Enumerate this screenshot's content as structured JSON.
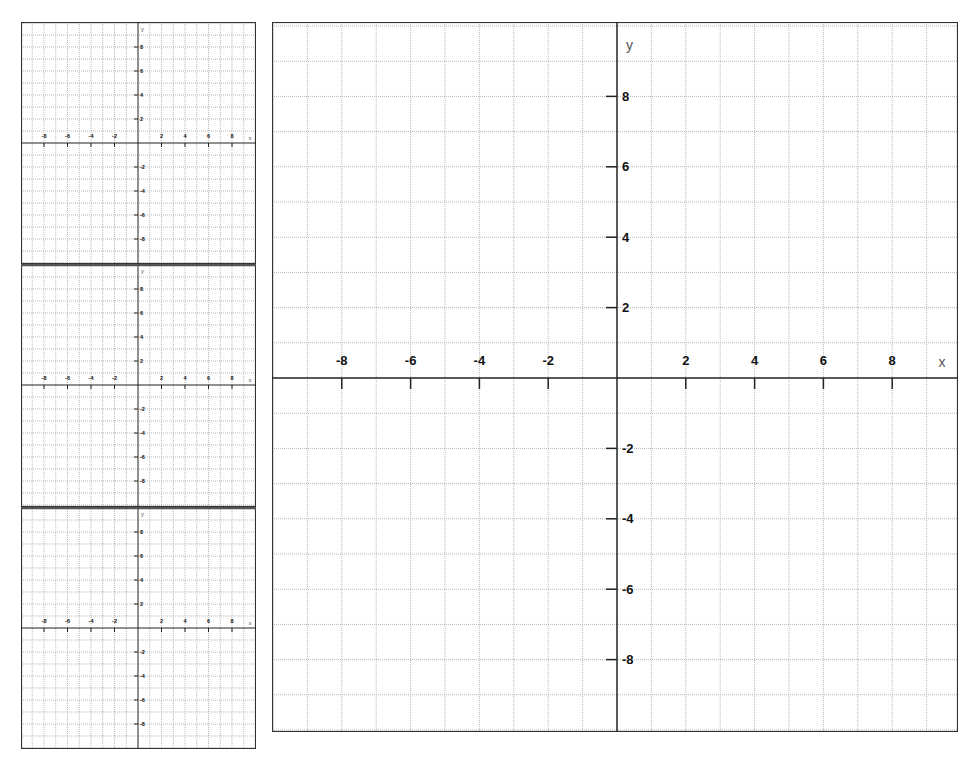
{
  "colors": {
    "background": "#ffffff",
    "grid": "#b8b8b8",
    "axis": "#222222",
    "border": "#333333",
    "divider": "#555555",
    "label": "#111111",
    "axis_name": "#555555"
  },
  "main_graph": {
    "x_axis_label": "x",
    "y_axis_label": "y",
    "x_range": [
      -10,
      10
    ],
    "y_range": [
      -10,
      10
    ],
    "grid_step": 1,
    "x_tick_labels": [
      "-8",
      "-6",
      "-4",
      "-2",
      "2",
      "4",
      "6",
      "8"
    ],
    "x_tick_values": [
      -8,
      -6,
      -4,
      -2,
      2,
      4,
      6,
      8
    ],
    "y_tick_labels": [
      "8",
      "6",
      "4",
      "2",
      "-2",
      "-4",
      "-6",
      "-8"
    ],
    "y_tick_values": [
      8,
      6,
      4,
      2,
      -2,
      -4,
      -6,
      -8
    ]
  },
  "small_graphs": [
    {
      "x_axis_label": "x",
      "y_axis_label": "y",
      "x_tick_labels": [
        "-8",
        "-6",
        "-4",
        "-2",
        "2",
        "4",
        "6",
        "8"
      ],
      "x_tick_values": [
        -8,
        -6,
        -4,
        -2,
        2,
        4,
        6,
        8
      ],
      "y_tick_labels": [
        "8",
        "6",
        "4",
        "2",
        "-2",
        "-4",
        "-6",
        "-8"
      ],
      "y_tick_values": [
        8,
        6,
        4,
        2,
        -2,
        -4,
        -6,
        -8
      ]
    },
    {
      "x_axis_label": "x",
      "y_axis_label": "y",
      "x_tick_labels": [
        "-8",
        "-6",
        "-4",
        "-2",
        "2",
        "4",
        "6",
        "8"
      ],
      "x_tick_values": [
        -8,
        -6,
        -4,
        -2,
        2,
        4,
        6,
        8
      ],
      "y_tick_labels": [
        "8",
        "6",
        "4",
        "2",
        "-2",
        "-4",
        "-6",
        "-8"
      ],
      "y_tick_values": [
        8,
        6,
        4,
        2,
        -2,
        -4,
        -6,
        -8
      ]
    },
    {
      "x_axis_label": "x",
      "y_axis_label": "y",
      "x_tick_labels": [
        "-8",
        "-6",
        "-4",
        "-2",
        "2",
        "4",
        "6",
        "8"
      ],
      "x_tick_values": [
        -8,
        -6,
        -4,
        -2,
        2,
        4,
        6,
        8
      ],
      "y_tick_labels": [
        "8",
        "6",
        "4",
        "2",
        "-2",
        "-4",
        "-6",
        "-8"
      ],
      "y_tick_values": [
        8,
        6,
        4,
        2,
        -2,
        -4,
        -6,
        -8
      ]
    }
  ]
}
